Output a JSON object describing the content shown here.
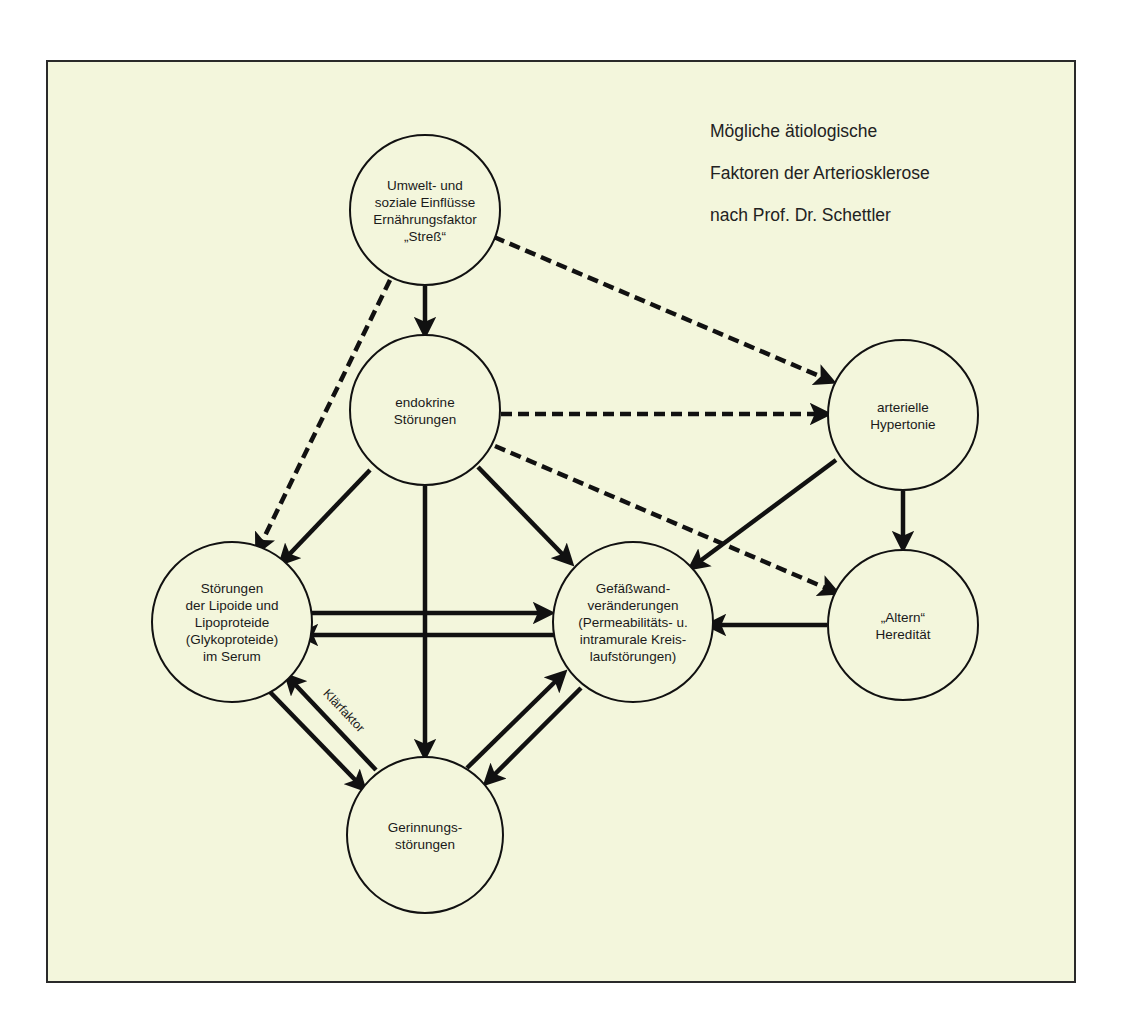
{
  "title": {
    "lines": [
      "Mögliche ätiologische",
      "Faktoren der Arteriosklerose",
      "nach Prof. Dr. Schettler"
    ]
  },
  "colors": {
    "background": "#f3f6dc",
    "stroke": "#111111",
    "node_fill": "#f3f6dc"
  },
  "nodes": [
    {
      "id": "umwelt",
      "cx": 425,
      "cy": 210,
      "r": 75,
      "lines": [
        "Umwelt- und",
        "soziale Einflüsse",
        "Ernährungsfaktor",
        "„Streß“"
      ]
    },
    {
      "id": "endokrine",
      "cx": 425,
      "cy": 410,
      "r": 75,
      "lines": [
        "endokrine",
        "Störungen"
      ]
    },
    {
      "id": "hypertonie",
      "cx": 903,
      "cy": 415,
      "r": 75,
      "lines": [
        "arterielle",
        "Hypertonie"
      ]
    },
    {
      "id": "lipoide",
      "cx": 232,
      "cy": 622,
      "r": 80,
      "lines": [
        "Störungen",
        "der Lipoide und",
        "Lipoproteide",
        "(Glykoproteide)",
        "im Serum"
      ]
    },
    {
      "id": "gefaesswand",
      "cx": 633,
      "cy": 622,
      "r": 80,
      "lines": [
        "Gefäßwand-",
        "veränderungen",
        "(Permeabilitäts- u.",
        "intramurale Kreis-",
        "laufstörungen)"
      ]
    },
    {
      "id": "altern",
      "cx": 903,
      "cy": 625,
      "r": 75,
      "lines": [
        "„Altern“",
        "Heredität"
      ]
    },
    {
      "id": "gerinnung",
      "cx": 425,
      "cy": 835,
      "r": 78,
      "lines": [
        "Gerinnungs-",
        "störungen"
      ]
    }
  ],
  "edges": [
    {
      "from": "umwelt",
      "to": "endokrine",
      "style": "solid",
      "x1": 425,
      "y1": 286,
      "x2": 425,
      "y2": 333
    },
    {
      "from": "umwelt",
      "to": "hypertonie",
      "style": "dashed",
      "x1": 494,
      "y1": 237,
      "x2": 831,
      "y2": 381
    },
    {
      "from": "umwelt",
      "to": "lipoide",
      "style": "dashed",
      "x1": 390,
      "y1": 280,
      "x2": 258,
      "y2": 550
    },
    {
      "from": "endokrine",
      "to": "hypertonie",
      "style": "dashed",
      "x1": 501,
      "y1": 414,
      "x2": 826,
      "y2": 414
    },
    {
      "from": "endokrine",
      "to": "altern",
      "style": "dashed",
      "x1": 495,
      "y1": 446,
      "x2": 835,
      "y2": 592
    },
    {
      "from": "endokrine",
      "to": "lipoide",
      "style": "solid",
      "x1": 370,
      "y1": 470,
      "x2": 282,
      "y2": 562
    },
    {
      "from": "endokrine",
      "to": "gefaesswand",
      "style": "solid",
      "x1": 478,
      "y1": 467,
      "x2": 570,
      "y2": 562
    },
    {
      "from": "endokrine",
      "to": "gerinnung",
      "style": "solid",
      "x1": 425,
      "y1": 486,
      "x2": 425,
      "y2": 755
    },
    {
      "from": "hypertonie",
      "to": "gefaesswand",
      "style": "solid",
      "x1": 836,
      "y1": 460,
      "x2": 692,
      "y2": 567
    },
    {
      "from": "hypertonie",
      "to": "altern",
      "style": "solid",
      "x1": 903,
      "y1": 491,
      "x2": 903,
      "y2": 547
    },
    {
      "from": "lipoide",
      "to": "gefaesswand",
      "style": "solid",
      "x1": 299,
      "y1": 613,
      "x2": 549,
      "y2": 613
    },
    {
      "from": "gefaesswand",
      "to": "lipoide",
      "style": "solid",
      "x1": 555,
      "y1": 635,
      "x2": 302,
      "y2": 635
    },
    {
      "from": "altern",
      "to": "gefaesswand",
      "style": "solid",
      "x1": 827,
      "y1": 625,
      "x2": 710,
      "y2": 625
    },
    {
      "from": "lipoide",
      "to": "gerinnung",
      "style": "solid",
      "x1": 270,
      "y1": 692,
      "x2": 363,
      "y2": 788
    },
    {
      "from": "gerinnung",
      "to": "lipoide",
      "style": "solid",
      "x1": 376,
      "y1": 770,
      "x2": 288,
      "y2": 677,
      "label": "Klärfaktor"
    },
    {
      "from": "gerinnung",
      "to": "gefaesswand",
      "style": "solid",
      "x1": 467,
      "y1": 768,
      "x2": 563,
      "y2": 674
    },
    {
      "from": "gefaesswand",
      "to": "gerinnung",
      "style": "solid",
      "x1": 581,
      "y1": 688,
      "x2": 487,
      "y2": 782
    }
  ]
}
